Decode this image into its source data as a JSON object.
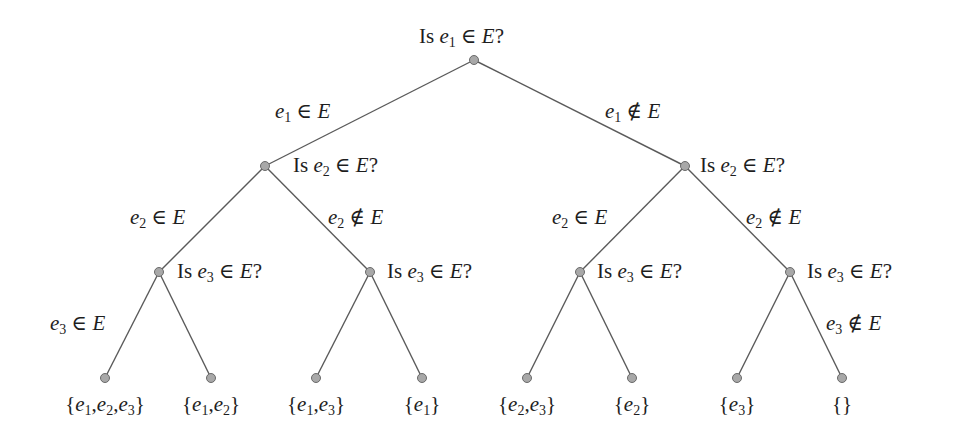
{
  "diagram": {
    "type": "binary-decision-tree",
    "colors": {
      "edge": "#5a5a5a",
      "node_fill": "#a8a8a8",
      "node_stroke": "#6a6a6a",
      "text": "#1e1e1e",
      "background": "#ffffff"
    },
    "nodes": [
      {
        "id": "root",
        "x": 474,
        "y": 60,
        "question": {
          "var": "e",
          "sub": "1",
          "rel": "∈",
          "set": "E",
          "prefix": "Is ",
          "suffix": "?"
        }
      },
      {
        "id": "L",
        "x": 265,
        "y": 166,
        "question": {
          "var": "e",
          "sub": "2",
          "rel": "∈",
          "set": "E",
          "prefix": "Is ",
          "suffix": "?"
        }
      },
      {
        "id": "R",
        "x": 685,
        "y": 166,
        "question": {
          "var": "e",
          "sub": "2",
          "rel": "∈",
          "set": "E",
          "prefix": "Is ",
          "suffix": "?"
        }
      },
      {
        "id": "LL",
        "x": 159,
        "y": 272,
        "question": {
          "var": "e",
          "sub": "3",
          "rel": "∈",
          "set": "E",
          "prefix": "Is ",
          "suffix": "?"
        }
      },
      {
        "id": "LR",
        "x": 370,
        "y": 272,
        "question": {
          "var": "e",
          "sub": "3",
          "rel": "∈",
          "set": "E",
          "prefix": "Is ",
          "suffix": "?"
        }
      },
      {
        "id": "RL",
        "x": 580,
        "y": 272,
        "question": {
          "var": "e",
          "sub": "3",
          "rel": "∈",
          "set": "E",
          "prefix": "Is ",
          "suffix": "?"
        }
      },
      {
        "id": "RR",
        "x": 790,
        "y": 272,
        "question": {
          "var": "e",
          "sub": "3",
          "rel": "∈",
          "set": "E",
          "prefix": "Is ",
          "suffix": "?"
        }
      }
    ],
    "edge_labels": [
      {
        "id": "root-L",
        "var": "e",
        "sub": "1",
        "rel": "∈",
        "set": "E"
      },
      {
        "id": "root-R",
        "var": "e",
        "sub": "1",
        "rel": "∉",
        "set": "E"
      },
      {
        "id": "L-LL",
        "var": "e",
        "sub": "2",
        "rel": "∈",
        "set": "E"
      },
      {
        "id": "L-LR",
        "var": "e",
        "sub": "2",
        "rel": "∉",
        "set": "E"
      },
      {
        "id": "R-RL",
        "var": "e",
        "sub": "2",
        "rel": "∈",
        "set": "E"
      },
      {
        "id": "R-RR",
        "var": "e",
        "sub": "2",
        "rel": "∉",
        "set": "E"
      },
      {
        "id": "LL-leaf0",
        "var": "e",
        "sub": "3",
        "rel": "∈",
        "set": "E"
      },
      {
        "id": "RR-leaf7",
        "var": "e",
        "sub": "3",
        "rel": "∉",
        "set": "E"
      }
    ],
    "leaves": [
      {
        "x": 105,
        "y": 378,
        "set": "{e1, e2, e3}",
        "elements": [
          "1",
          "2",
          "3"
        ]
      },
      {
        "x": 211,
        "y": 378,
        "set": "{e1, e2}",
        "elements": [
          "1",
          "2"
        ]
      },
      {
        "x": 316,
        "y": 378,
        "set": "{e1, e3}",
        "elements": [
          "1",
          "3"
        ]
      },
      {
        "x": 422,
        "y": 378,
        "set": "{e1}",
        "elements": [
          "1"
        ]
      },
      {
        "x": 527,
        "y": 378,
        "set": "{e2, e3}",
        "elements": [
          "2",
          "3"
        ]
      },
      {
        "x": 632,
        "y": 378,
        "set": "{e2}",
        "elements": [
          "2"
        ]
      },
      {
        "x": 737,
        "y": 378,
        "set": "{e3}",
        "elements": [
          "3"
        ]
      },
      {
        "x": 842,
        "y": 378,
        "set": "{}",
        "elements": []
      }
    ],
    "text": {
      "is": "Is ",
      "q": "?",
      "e": "e",
      "E": "E",
      "in": " ∈ ",
      "notin": " ∉ ",
      "lbrace": "{",
      "rbrace": "}",
      "comma": ",",
      "s1": "1",
      "s2": "2",
      "s3": "3"
    }
  }
}
